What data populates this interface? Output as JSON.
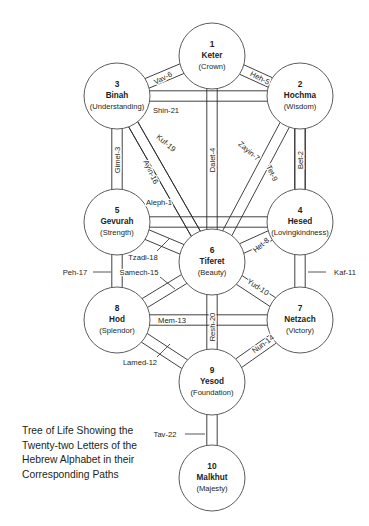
{
  "diagram": {
    "title": "Tree of Life Showing the Twenty-two Letters of the Hebrew Alphabet in their Corresponding Paths",
    "caption": "Tree of Life Showing the\nTwenty-two Letters of the\nHebrew Alphabet in their\nCorresponding Paths",
    "background_color": "#ffffff",
    "line_color": "#2b2b2b",
    "text_color": "#231f20"
  },
  "sephirot": [
    {
      "number": "1",
      "name": "Keter",
      "meaning": "(Crown)",
      "cx": 212,
      "cy": 56,
      "r": 33
    },
    {
      "number": "2",
      "name": "Hochma",
      "meaning": "(Wisdom)",
      "cx": 300,
      "cy": 96,
      "r": 33
    },
    {
      "number": "3",
      "name": "Binah",
      "meaning": "(Understanding)",
      "cx": 117,
      "cy": 96,
      "r": 33
    },
    {
      "number": "4",
      "name": "Hesed",
      "meaning": "(Lovingkindness)",
      "cx": 300,
      "cy": 222,
      "r": 33
    },
    {
      "number": "5",
      "name": "Gevurah",
      "meaning": "(Strength)",
      "cx": 117,
      "cy": 222,
      "r": 33
    },
    {
      "number": "6",
      "name": "Tiferet",
      "meaning": "(Beauty)",
      "cx": 212,
      "cy": 262,
      "r": 33
    },
    {
      "number": "7",
      "name": "Netzach",
      "meaning": "(Victory)",
      "cx": 300,
      "cy": 320,
      "r": 33
    },
    {
      "number": "8",
      "name": "Hod",
      "meaning": "(Splendor)",
      "cx": 117,
      "cy": 320,
      "r": 33
    },
    {
      "number": "9",
      "name": "Yesod",
      "meaning": "(Foundation)",
      "cx": 212,
      "cy": 382,
      "r": 33
    },
    {
      "number": "10",
      "name": "Malkhut",
      "meaning": "(Majesty)",
      "cx": 212,
      "cy": 478,
      "r": 33
    }
  ],
  "paths": [
    {
      "label": "Aleph-1",
      "letter": "Aleph",
      "number": 1,
      "from": "5",
      "to": "4",
      "lx": 159,
      "ly": 202,
      "rot": 0
    },
    {
      "label": "Bet-2",
      "letter": "Bet",
      "number": 2,
      "from": "2",
      "to": "4",
      "lx": 300,
      "ly": 160,
      "rot": -90
    },
    {
      "label": "Gimel-3",
      "letter": "Gimel",
      "number": 3,
      "from": "3",
      "to": "5",
      "lx": 117,
      "ly": 160,
      "rot": -90
    },
    {
      "label": "Dalet-4",
      "letter": "Dalet",
      "number": 4,
      "from": "1",
      "to": "6",
      "lx": 212,
      "ly": 160,
      "rot": -90
    },
    {
      "label": "Heh-5",
      "letter": "Heh",
      "number": 5,
      "from": "1",
      "to": "2",
      "lx": 260,
      "ly": 78,
      "rot": 27
    },
    {
      "label": "Vav-6",
      "letter": "Vav",
      "number": 6,
      "from": "1",
      "to": "3",
      "lx": 163,
      "ly": 78,
      "rot": -27
    },
    {
      "label": "Zayin-7",
      "letter": "Zayin",
      "number": 7,
      "from": "2",
      "to": "6",
      "lx": 249,
      "ly": 151,
      "rot": 40
    },
    {
      "label": "Het-8",
      "letter": "Het",
      "number": 8,
      "from": "4",
      "to": "6",
      "lx": 261,
      "ly": 245,
      "rot": -41
    },
    {
      "label": "Tet-9",
      "letter": "Tet",
      "number": 9,
      "from": "2",
      "to": "4",
      "lx": 272,
      "ly": 173,
      "rot": 65
    },
    {
      "label": "Yud-10",
      "letter": "Yud",
      "number": 10,
      "from": "6",
      "to": "7",
      "lx": 258,
      "ly": 287,
      "rot": 33
    },
    {
      "label": "Kaf-11",
      "letter": "Kaf",
      "number": 11,
      "from": "4",
      "to": "7",
      "lx": 345,
      "ly": 272,
      "rot": 0
    },
    {
      "label": "Lamed-12",
      "letter": "Lamed",
      "number": 12,
      "from": "8",
      "to": "9",
      "lx": 140,
      "ly": 362,
      "rot": 0
    },
    {
      "label": "Mem-13",
      "letter": "Mem",
      "number": 13,
      "from": "8",
      "to": "7",
      "lx": 172,
      "ly": 320,
      "rot": 0
    },
    {
      "label": "Nun-14",
      "letter": "Nun",
      "number": 14,
      "from": "9",
      "to": "7",
      "lx": 263,
      "ly": 344,
      "rot": -37
    },
    {
      "label": "Samech-15",
      "letter": "Samech",
      "number": 15,
      "from": "6",
      "to": "8",
      "lx": 139,
      "ly": 272,
      "rot": 0
    },
    {
      "label": "Ayin-16",
      "letter": "Ayin",
      "number": 16,
      "from": "3",
      "to": "6",
      "lx": 151,
      "ly": 172,
      "rot": 65
    },
    {
      "label": "Peh-17",
      "letter": "Peh",
      "number": 17,
      "from": "5",
      "to": "8",
      "lx": 75,
      "ly": 272,
      "rot": 0
    },
    {
      "label": "Tzadi-18",
      "letter": "Tzadi",
      "number": 18,
      "from": "5",
      "to": "6",
      "lx": 143,
      "ly": 257,
      "rot": 0
    },
    {
      "label": "Kuf-19",
      "letter": "Kuf",
      "number": 19,
      "from": "3",
      "to": "6",
      "lx": 166,
      "ly": 143,
      "rot": 40
    },
    {
      "label": "Resh-20",
      "letter": "Resh",
      "number": 20,
      "from": "6",
      "to": "9",
      "lx": 212,
      "ly": 327,
      "rot": -90
    },
    {
      "label": "Shin-21",
      "letter": "Shin",
      "number": 21,
      "from": "3",
      "to": "2",
      "lx": 166,
      "ly": 110,
      "rot": 0
    },
    {
      "label": "Tav-22",
      "letter": "Tav",
      "number": 22,
      "from": "9",
      "to": "10",
      "lx": 165,
      "ly": 434,
      "rot": 0
    }
  ]
}
